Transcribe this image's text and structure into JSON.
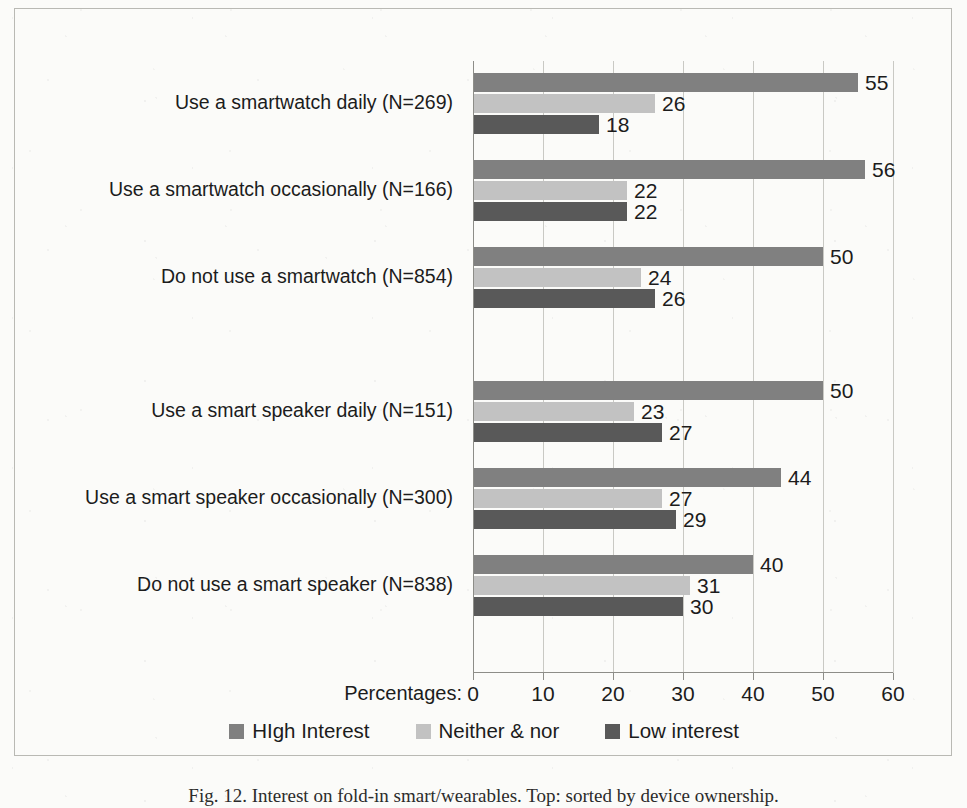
{
  "figure": {
    "caption": "Fig. 12. Interest on fold-in smart/wearables. Top: sorted by device ownership."
  },
  "legend": {
    "position": "bottom-center",
    "items": [
      {
        "label": "HIgh Interest",
        "color": "#808080"
      },
      {
        "label": "Neither & nor",
        "color": "#c2c2c2"
      },
      {
        "label": "Low interest",
        "color": "#595959"
      }
    ]
  },
  "axis": {
    "prefix_label": "Percentages:",
    "ticks": [
      "0",
      "10",
      "20",
      "30",
      "40",
      "50",
      "60"
    ]
  },
  "chart_data": {
    "type": "bar",
    "orientation": "horizontal",
    "title": "",
    "xlabel": "Percentages:",
    "ylabel": "",
    "xlim": [
      0,
      60
    ],
    "xticks": [
      0,
      10,
      20,
      30,
      40,
      50,
      60
    ],
    "grid": true,
    "legend_position": "bottom-center",
    "categories": [
      "Use a smartwatch daily (N=269)",
      "Use a smartwatch occasionally (N=166)",
      "Do not use a smartwatch (N=854)",
      "Use a smart speaker daily (N=151)",
      "Use a smart speaker occasionally (N=300)",
      "Do not use a smart speaker (N=838)"
    ],
    "group_breaks": [
      3
    ],
    "series": [
      {
        "name": "HIgh Interest",
        "color": "#808080",
        "values": [
          55,
          56,
          50,
          50,
          44,
          40
        ]
      },
      {
        "name": "Neither & nor",
        "color": "#c2c2c2",
        "values": [
          26,
          22,
          24,
          23,
          27,
          31
        ]
      },
      {
        "name": "Low interest",
        "color": "#595959",
        "values": [
          18,
          22,
          26,
          27,
          29,
          30
        ]
      }
    ]
  }
}
